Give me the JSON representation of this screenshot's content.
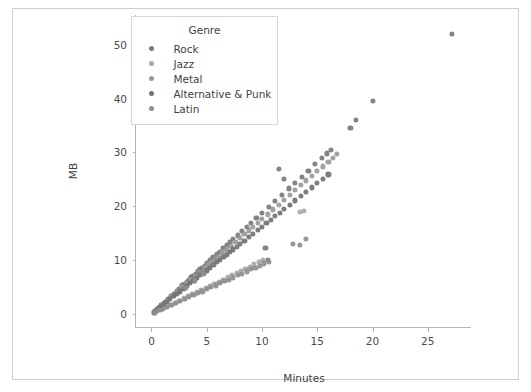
{
  "chart_data": {
    "type": "scatter",
    "title": "",
    "xlabel": "Minutes",
    "ylabel": "MB",
    "xlim": [
      -1.4,
      29.0
    ],
    "ylim": [
      -2.6,
      55.5
    ],
    "xticks": [
      0,
      5,
      10,
      15,
      20,
      25
    ],
    "yticks": [
      0,
      10,
      20,
      30,
      40,
      50
    ],
    "grid": false,
    "legend": {
      "title": "Genre",
      "position": "upper-left-inside",
      "entries": [
        {
          "label": "Rock",
          "color": "#7a7a7a"
        },
        {
          "label": "Jazz",
          "color": "#a8a8a8"
        },
        {
          "label": "Metal",
          "color": "#9a9a9a"
        },
        {
          "label": "Alternative & Punk",
          "color": "#727272"
        },
        {
          "label": "Latin",
          "color": "#8e8e8e"
        }
      ]
    },
    "series": [
      {
        "name": "Rock",
        "color": "#7a7a7a",
        "points": [
          [
            0.3,
            0.6
          ],
          [
            0.6,
            1.1
          ],
          [
            0.9,
            1.7
          ],
          [
            1.2,
            2.2
          ],
          [
            1.5,
            2.8
          ],
          [
            1.8,
            3.4
          ],
          [
            2.0,
            3.8
          ],
          [
            2.3,
            4.3
          ],
          [
            2.5,
            4.7
          ],
          [
            2.8,
            5.3
          ],
          [
            3.0,
            5.6
          ],
          [
            3.2,
            6.0
          ],
          [
            3.4,
            6.4
          ],
          [
            3.6,
            6.8
          ],
          [
            3.8,
            7.1
          ],
          [
            4.0,
            7.5
          ],
          [
            4.2,
            7.9
          ],
          [
            4.4,
            8.3
          ],
          [
            4.6,
            8.6
          ],
          [
            4.8,
            9.0
          ],
          [
            5.0,
            9.4
          ],
          [
            5.3,
            10.0
          ],
          [
            5.6,
            10.5
          ],
          [
            5.9,
            11.1
          ],
          [
            6.2,
            11.6
          ],
          [
            6.5,
            12.2
          ],
          [
            6.8,
            12.8
          ],
          [
            7.1,
            13.3
          ],
          [
            7.4,
            13.9
          ],
          [
            7.8,
            14.6
          ],
          [
            8.2,
            15.4
          ],
          [
            8.6,
            16.1
          ],
          [
            9.0,
            16.9
          ],
          [
            9.5,
            17.8
          ],
          [
            10.0,
            18.8
          ],
          [
            10.6,
            19.9
          ],
          [
            11.2,
            21.0
          ],
          [
            11.8,
            22.1
          ],
          [
            12.4,
            23.3
          ],
          [
            13.0,
            24.4
          ],
          [
            13.6,
            25.5
          ],
          [
            14.2,
            26.6
          ],
          [
            14.8,
            27.8
          ],
          [
            15.4,
            28.9
          ],
          [
            15.9,
            29.8
          ],
          [
            16.2,
            30.4
          ],
          [
            11.5,
            27.0
          ],
          [
            12.0,
            25.0
          ],
          [
            10.3,
            12.3
          ],
          [
            10.5,
            10.0
          ],
          [
            18.0,
            34.5
          ],
          [
            18.5,
            36.0
          ],
          [
            20.0,
            39.5
          ],
          [
            27.2,
            52.0
          ]
        ]
      },
      {
        "name": "Jazz",
        "color": "#a8a8a8",
        "points": [
          [
            0.4,
            0.4
          ],
          [
            0.8,
            0.8
          ],
          [
            1.3,
            1.3
          ],
          [
            1.7,
            1.7
          ],
          [
            2.1,
            2.1
          ],
          [
            2.5,
            2.5
          ],
          [
            2.9,
            2.9
          ],
          [
            3.3,
            3.3
          ],
          [
            3.7,
            3.7
          ],
          [
            4.1,
            4.0
          ],
          [
            4.5,
            4.4
          ],
          [
            4.9,
            4.8
          ],
          [
            5.3,
            5.2
          ],
          [
            5.7,
            5.6
          ],
          [
            6.1,
            6.0
          ],
          [
            6.5,
            6.4
          ],
          [
            6.9,
            6.8
          ],
          [
            7.3,
            7.2
          ],
          [
            7.7,
            7.6
          ],
          [
            8.1,
            8.0
          ],
          [
            8.5,
            8.4
          ],
          [
            8.9,
            8.8
          ],
          [
            9.3,
            9.2
          ],
          [
            9.7,
            9.6
          ],
          [
            10.1,
            10.0
          ],
          [
            5.0,
            8.8
          ],
          [
            5.5,
            9.6
          ],
          [
            6.0,
            10.5
          ],
          [
            6.6,
            11.5
          ],
          [
            7.2,
            12.6
          ],
          [
            13.4,
            19.0
          ],
          [
            13.8,
            19.1
          ]
        ]
      },
      {
        "name": "Metal",
        "color": "#9a9a9a",
        "points": [
          [
            0.5,
            0.9
          ],
          [
            1.0,
            1.8
          ],
          [
            1.4,
            2.5
          ],
          [
            1.9,
            3.4
          ],
          [
            2.4,
            4.3
          ],
          [
            2.8,
            5.0
          ],
          [
            3.2,
            5.7
          ],
          [
            3.6,
            6.4
          ],
          [
            4.0,
            7.1
          ],
          [
            4.4,
            7.8
          ],
          [
            4.8,
            8.5
          ],
          [
            5.2,
            9.2
          ],
          [
            5.6,
            9.9
          ],
          [
            6.0,
            10.6
          ],
          [
            6.4,
            11.3
          ],
          [
            6.8,
            12.0
          ],
          [
            7.2,
            12.7
          ],
          [
            7.6,
            13.4
          ],
          [
            8.0,
            14.1
          ],
          [
            8.4,
            14.8
          ],
          [
            8.8,
            15.5
          ],
          [
            9.2,
            16.2
          ],
          [
            9.6,
            16.9
          ],
          [
            10.0,
            17.6
          ],
          [
            10.5,
            18.5
          ],
          [
            11.0,
            19.4
          ],
          [
            11.5,
            20.3
          ],
          [
            12.0,
            21.2
          ],
          [
            12.5,
            22.1
          ],
          [
            13.0,
            23.0
          ],
          [
            13.5,
            23.9
          ],
          [
            14.0,
            24.8
          ],
          [
            14.5,
            25.6
          ],
          [
            15.0,
            26.5
          ],
          [
            15.5,
            27.4
          ],
          [
            16.0,
            28.3
          ],
          [
            16.4,
            29.0
          ],
          [
            16.8,
            29.7
          ]
        ]
      },
      {
        "name": "Alternative & Punk",
        "color": "#727272",
        "points": [
          [
            0.2,
            0.3
          ],
          [
            0.5,
            0.8
          ],
          [
            0.8,
            1.3
          ],
          [
            1.1,
            1.8
          ],
          [
            1.4,
            2.3
          ],
          [
            1.7,
            2.8
          ],
          [
            2.0,
            3.3
          ],
          [
            2.3,
            3.8
          ],
          [
            2.6,
            4.2
          ],
          [
            2.9,
            4.7
          ],
          [
            3.2,
            5.2
          ],
          [
            3.5,
            5.7
          ],
          [
            3.8,
            6.2
          ],
          [
            4.1,
            6.7
          ],
          [
            4.4,
            7.2
          ],
          [
            4.7,
            7.6
          ],
          [
            5.0,
            8.1
          ],
          [
            5.3,
            8.6
          ],
          [
            5.6,
            9.1
          ],
          [
            5.9,
            9.6
          ],
          [
            6.2,
            10.1
          ],
          [
            6.5,
            10.6
          ],
          [
            6.8,
            11.0
          ],
          [
            7.1,
            11.5
          ],
          [
            7.4,
            12.0
          ],
          [
            7.7,
            12.5
          ],
          [
            8.0,
            13.0
          ],
          [
            8.4,
            13.6
          ],
          [
            8.8,
            14.3
          ],
          [
            9.2,
            14.9
          ],
          [
            9.6,
            15.6
          ],
          [
            10.0,
            16.2
          ],
          [
            10.4,
            16.9
          ],
          [
            10.8,
            17.5
          ],
          [
            11.2,
            18.2
          ],
          [
            11.6,
            18.8
          ],
          [
            12.0,
            19.5
          ],
          [
            12.5,
            20.3
          ],
          [
            13.0,
            21.1
          ],
          [
            13.5,
            21.9
          ],
          [
            14.0,
            22.7
          ],
          [
            14.5,
            23.5
          ],
          [
            15.0,
            24.3
          ],
          [
            15.5,
            25.1
          ],
          [
            16.0,
            25.9
          ]
        ]
      },
      {
        "name": "Latin",
        "color": "#8e8e8e",
        "points": [
          [
            0.3,
            0.3
          ],
          [
            0.7,
            0.7
          ],
          [
            1.0,
            1.0
          ],
          [
            1.4,
            1.3
          ],
          [
            1.8,
            1.7
          ],
          [
            2.2,
            2.0
          ],
          [
            2.6,
            2.4
          ],
          [
            3.0,
            2.8
          ],
          [
            3.4,
            3.1
          ],
          [
            3.8,
            3.5
          ],
          [
            4.2,
            3.9
          ],
          [
            4.6,
            4.2
          ],
          [
            5.0,
            4.6
          ],
          [
            5.4,
            5.0
          ],
          [
            5.8,
            5.3
          ],
          [
            6.2,
            5.7
          ],
          [
            6.6,
            6.1
          ],
          [
            7.0,
            6.4
          ],
          [
            7.4,
            6.8
          ],
          [
            7.8,
            7.2
          ],
          [
            8.2,
            7.5
          ],
          [
            8.6,
            7.9
          ],
          [
            9.0,
            8.3
          ],
          [
            9.4,
            8.6
          ],
          [
            9.8,
            9.0
          ],
          [
            10.2,
            9.4
          ],
          [
            10.6,
            9.7
          ],
          [
            3.1,
            4.9
          ],
          [
            3.9,
            6.2
          ],
          [
            4.7,
            7.4
          ],
          [
            12.8,
            13.0
          ],
          [
            13.4,
            12.8
          ],
          [
            14.0,
            14.0
          ]
        ]
      }
    ]
  }
}
